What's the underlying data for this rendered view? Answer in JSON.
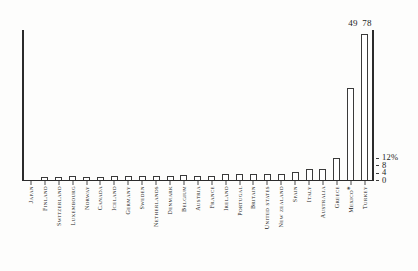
{
  "chart_data": {
    "type": "bar",
    "title": "",
    "subtitle": "",
    "xlabel": "",
    "ylabel": "",
    "unit_label": "%",
    "ylim": [
      0,
      80
    ],
    "grid": false,
    "legend": null,
    "axis_side": "right",
    "y_ticks": [
      {
        "value": 0,
        "label": "0"
      },
      {
        "value": 4,
        "label": "4"
      },
      {
        "value": 8,
        "label": "8"
      },
      {
        "value": 12,
        "label": "12%"
      }
    ],
    "categories": [
      "Japan",
      "Finland",
      "Switzerland",
      "Luxembourg",
      "Norway",
      "Canada",
      "Iceland",
      "Germany",
      "Sweden",
      "Netherlands",
      "Denmark",
      "Belgium",
      "Austria",
      "France",
      "Ireland",
      "Portugal",
      "Britain",
      "United States",
      "New Zealand",
      "Spain",
      "Italy",
      "Australia",
      "Greece",
      "Mexico*",
      "Turkey"
    ],
    "values": [
      0.2,
      1.4,
      1.6,
      2.0,
      1.8,
      1.7,
      2.4,
      2.2,
      2.3,
      2.4,
      2.1,
      2.8,
      2.3,
      2.3,
      3.3,
      3.1,
      3.3,
      3.0,
      3.1,
      4.2,
      5.7,
      5.7,
      11.5,
      49,
      78
    ],
    "value_labels": [
      "",
      "",
      "",
      "",
      "",
      "",
      "",
      "",
      "",
      "",
      "",
      "",
      "",
      "",
      "",
      "",
      "",
      "",
      "",
      "",
      "",
      "",
      "",
      "49",
      "78"
    ],
    "colors": {
      "bar_fill": "#ffffff",
      "bar_stroke": "#3a3a3a",
      "axis": "#2b2b2b",
      "text": "#1b1b1b",
      "background": "#fdfdfc"
    }
  }
}
